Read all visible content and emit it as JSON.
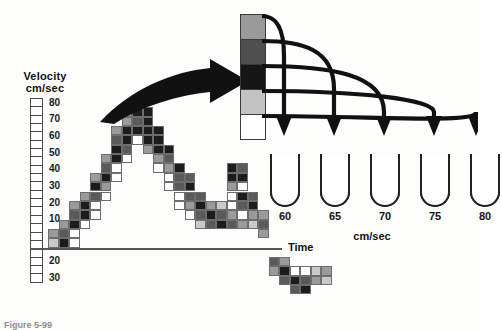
{
  "figure": {
    "caption": "Figure 5-99"
  },
  "velocity_axis": {
    "title_line1": "Velocity",
    "title_line2": "cm/sec",
    "positive_labels": [
      "80",
      "70",
      "60",
      "50",
      "40",
      "30",
      "20",
      "10"
    ],
    "negative_labels": [
      "10",
      "20",
      "30"
    ],
    "box_count_positive": 16,
    "box_count_negative": 6,
    "units": "cm/sec"
  },
  "time_axis": {
    "label": "Time"
  },
  "scale_bar": {
    "name": "grayscale-amplitude-scale",
    "segments": [
      {
        "index": 0,
        "color": "#9a9a9a",
        "maps_to": "60"
      },
      {
        "index": 1,
        "color": "#4f4f4f",
        "maps_to": "65"
      },
      {
        "index": 2,
        "color": "#161616",
        "maps_to": "70"
      },
      {
        "index": 3,
        "color": "#c3c3c3",
        "maps_to": "75"
      },
      {
        "index": 4,
        "color": "#ffffff",
        "maps_to": "80"
      }
    ]
  },
  "tubes": {
    "units": "cm/sec",
    "items": [
      {
        "label": "60",
        "fill_fraction": 0.34
      },
      {
        "label": "65",
        "fill_fraction": 0.62
      },
      {
        "label": "70",
        "fill_fraction": 0.92
      },
      {
        "label": "75",
        "fill_fraction": 0.6
      },
      {
        "label": "80",
        "fill_fraction": 0.36
      }
    ]
  },
  "arrows": {
    "big_arrow_name": "spectrum-to-scale-arrow",
    "curved_arrow_count": 5
  },
  "chart_data": {
    "type": "heatmap",
    "xlabel": "Time",
    "ylabel": "Velocity cm/sec",
    "ylim": [
      -35,
      85
    ],
    "grid": true,
    "legend": "none",
    "cell_width": 10.5,
    "cell_height": 9.35,
    "gray_levels": {
      "0": "#ffffff",
      "1": "#c9c9c9",
      "2": "#9a9a9a",
      "3": "#5a5a5a",
      "4": "#1c1c1c"
    },
    "cells": [
      {
        "col": 0,
        "row": 15,
        "v": 1
      },
      {
        "col": 0,
        "row": 14,
        "v": 2
      },
      {
        "col": 1,
        "row": 15,
        "v": 4
      },
      {
        "col": 1,
        "row": 14,
        "v": 3
      },
      {
        "col": 1,
        "row": 13,
        "v": 2
      },
      {
        "col": 2,
        "row": 15,
        "v": 0
      },
      {
        "col": 2,
        "row": 14,
        "v": 0
      },
      {
        "col": 2,
        "row": 13,
        "v": 4
      },
      {
        "col": 2,
        "row": 12,
        "v": 3
      },
      {
        "col": 2,
        "row": 11,
        "v": 2
      },
      {
        "col": 3,
        "row": 13,
        "v": 0
      },
      {
        "col": 3,
        "row": 12,
        "v": 4
      },
      {
        "col": 3,
        "row": 11,
        "v": 4
      },
      {
        "col": 3,
        "row": 10,
        "v": 2
      },
      {
        "col": 4,
        "row": 12,
        "v": 0
      },
      {
        "col": 4,
        "row": 11,
        "v": 0
      },
      {
        "col": 4,
        "row": 10,
        "v": 3
      },
      {
        "col": 4,
        "row": 9,
        "v": 4
      },
      {
        "col": 4,
        "row": 8,
        "v": 2
      },
      {
        "col": 5,
        "row": 10,
        "v": 0
      },
      {
        "col": 5,
        "row": 9,
        "v": 2
      },
      {
        "col": 5,
        "row": 8,
        "v": 4
      },
      {
        "col": 5,
        "row": 7,
        "v": 3
      },
      {
        "col": 5,
        "row": 6,
        "v": 2
      },
      {
        "col": 6,
        "row": 8,
        "v": 0
      },
      {
        "col": 6,
        "row": 7,
        "v": 0
      },
      {
        "col": 6,
        "row": 6,
        "v": 4
      },
      {
        "col": 6,
        "row": 5,
        "v": 4
      },
      {
        "col": 6,
        "row": 4,
        "v": 3
      },
      {
        "col": 6,
        "row": 3,
        "v": 2
      },
      {
        "col": 7,
        "row": 6,
        "v": 0
      },
      {
        "col": 7,
        "row": 5,
        "v": 3
      },
      {
        "col": 7,
        "row": 4,
        "v": 4
      },
      {
        "col": 7,
        "row": 3,
        "v": 4
      },
      {
        "col": 7,
        "row": 2,
        "v": 2
      },
      {
        "col": 7,
        "row": 1,
        "v": 2
      },
      {
        "col": 8,
        "row": 4,
        "v": 0
      },
      {
        "col": 8,
        "row": 3,
        "v": 4
      },
      {
        "col": 8,
        "row": 2,
        "v": 3
      },
      {
        "col": 8,
        "row": 1,
        "v": 4
      },
      {
        "col": 8,
        "row": 0,
        "v": 2
      },
      {
        "col": 9,
        "row": 5,
        "v": 2
      },
      {
        "col": 9,
        "row": 4,
        "v": 4
      },
      {
        "col": 9,
        "row": 3,
        "v": 4
      },
      {
        "col": 9,
        "row": 2,
        "v": 4
      },
      {
        "col": 9,
        "row": 1,
        "v": 4
      },
      {
        "col": 10,
        "row": 7,
        "v": 0
      },
      {
        "col": 10,
        "row": 6,
        "v": 2
      },
      {
        "col": 10,
        "row": 5,
        "v": 4
      },
      {
        "col": 10,
        "row": 4,
        "v": 4
      },
      {
        "col": 10,
        "row": 3,
        "v": 4
      },
      {
        "col": 11,
        "row": 9,
        "v": 0
      },
      {
        "col": 11,
        "row": 8,
        "v": 0
      },
      {
        "col": 11,
        "row": 7,
        "v": 2
      },
      {
        "col": 11,
        "row": 6,
        "v": 3
      },
      {
        "col": 11,
        "row": 5,
        "v": 4
      },
      {
        "col": 12,
        "row": 11,
        "v": 0
      },
      {
        "col": 12,
        "row": 10,
        "v": 0
      },
      {
        "col": 12,
        "row": 9,
        "v": 3
      },
      {
        "col": 12,
        "row": 8,
        "v": 3
      },
      {
        "col": 12,
        "row": 7,
        "v": 4
      },
      {
        "col": 13,
        "row": 12,
        "v": 0
      },
      {
        "col": 13,
        "row": 11,
        "v": 2
      },
      {
        "col": 13,
        "row": 10,
        "v": 3
      },
      {
        "col": 13,
        "row": 9,
        "v": 4
      },
      {
        "col": 13,
        "row": 8,
        "v": 3
      },
      {
        "col": 14,
        "row": 13,
        "v": 1
      },
      {
        "col": 14,
        "row": 12,
        "v": 3
      },
      {
        "col": 14,
        "row": 11,
        "v": 4
      },
      {
        "col": 14,
        "row": 10,
        "v": 3
      },
      {
        "col": 15,
        "row": 13,
        "v": 3
      },
      {
        "col": 15,
        "row": 12,
        "v": 4
      },
      {
        "col": 15,
        "row": 11,
        "v": 2
      },
      {
        "col": 16,
        "row": 13,
        "v": 4
      },
      {
        "col": 16,
        "row": 12,
        "v": 3
      },
      {
        "col": 16,
        "row": 11,
        "v": 1
      },
      {
        "col": 17,
        "row": 13,
        "v": 3
      },
      {
        "col": 17,
        "row": 12,
        "v": 2
      },
      {
        "col": 17,
        "row": 11,
        "v": 0
      },
      {
        "col": 17,
        "row": 10,
        "v": 0
      },
      {
        "col": 17,
        "row": 9,
        "v": 2
      },
      {
        "col": 17,
        "row": 8,
        "v": 4
      },
      {
        "col": 17,
        "row": 7,
        "v": 4
      },
      {
        "col": 18,
        "row": 13,
        "v": 2
      },
      {
        "col": 18,
        "row": 12,
        "v": 0
      },
      {
        "col": 18,
        "row": 11,
        "v": 3
      },
      {
        "col": 18,
        "row": 10,
        "v": 4
      },
      {
        "col": 18,
        "row": 9,
        "v": 0
      },
      {
        "col": 18,
        "row": 8,
        "v": 4
      },
      {
        "col": 18,
        "row": 7,
        "v": 3
      },
      {
        "col": 19,
        "row": 13,
        "v": 1
      },
      {
        "col": 19,
        "row": 12,
        "v": 2
      },
      {
        "col": 19,
        "row": 11,
        "v": 4
      },
      {
        "col": 19,
        "row": 10,
        "v": 3
      },
      {
        "col": 20,
        "row": 14,
        "v": 2
      },
      {
        "col": 20,
        "row": 13,
        "v": 3
      },
      {
        "col": 20,
        "row": 12,
        "v": 2
      },
      {
        "col": 21,
        "row": 17,
        "v": 3
      },
      {
        "col": 21,
        "row": 18,
        "v": 2
      },
      {
        "col": 22,
        "row": 17,
        "v": 2
      },
      {
        "col": 22,
        "row": 18,
        "v": 4
      },
      {
        "col": 22,
        "row": 19,
        "v": 3
      },
      {
        "col": 23,
        "row": 18,
        "v": 0
      },
      {
        "col": 23,
        "row": 19,
        "v": 4
      },
      {
        "col": 23,
        "row": 20,
        "v": 3
      },
      {
        "col": 24,
        "row": 18,
        "v": 0
      },
      {
        "col": 24,
        "row": 19,
        "v": 3
      },
      {
        "col": 24,
        "row": 20,
        "v": 4
      },
      {
        "col": 25,
        "row": 18,
        "v": 1
      },
      {
        "col": 25,
        "row": 19,
        "v": 2
      },
      {
        "col": 26,
        "row": 18,
        "v": 2
      },
      {
        "col": 26,
        "row": 19,
        "v": 1
      }
    ]
  }
}
